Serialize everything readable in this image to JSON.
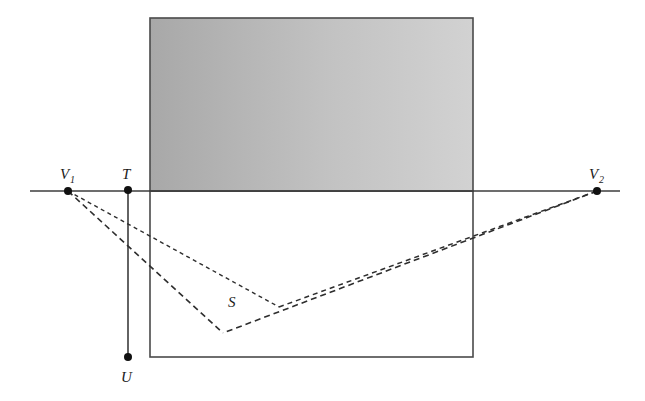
{
  "figure": {
    "kind": "perspective-construction-diagram",
    "background_color": "#ffffff",
    "stroke_color": "#3d3d3d",
    "label_color": "#1a1a1a",
    "canvas": {
      "width": 645,
      "height": 401
    }
  },
  "horizon": {
    "name": "horizon-line",
    "x1": 30,
    "y1": 191,
    "x2": 620,
    "y2": 191,
    "style": "solid",
    "width": 1.6
  },
  "shaded_panel": {
    "name": "shaded-rectangle",
    "x": 150,
    "y": 18,
    "width": 323,
    "height": 173,
    "fill_left": "#a8a8a8",
    "fill_right": "#d2d2d2",
    "border_color": "#4a4a4a",
    "border_width": 1.6
  },
  "ground_panel": {
    "name": "ground-rectangle",
    "x": 150,
    "y": 191,
    "width": 323,
    "height": 166,
    "fill": "#ffffff",
    "border_color": "#4a4a4a",
    "border_width": 1.6
  },
  "vertical_edge": {
    "name": "vertical-edge-TU",
    "x": 128,
    "y_top": 190,
    "y_bottom": 357,
    "style": "solid",
    "width": 1.6
  },
  "points": [
    {
      "id": "V1",
      "label": "V",
      "subscript": "1",
      "x": 68,
      "y": 191,
      "label_x": 60,
      "label_y": 179,
      "radius": 4.0
    },
    {
      "id": "T",
      "label": "T",
      "subscript": "",
      "x": 128,
      "y": 190,
      "label_x": 122,
      "label_y": 179,
      "radius": 4.0
    },
    {
      "id": "U",
      "label": "U",
      "subscript": "",
      "x": 128,
      "y": 357,
      "label_x": 121,
      "label_y": 382,
      "radius": 4.0
    },
    {
      "id": "V2",
      "label": "V",
      "subscript": "2",
      "x": 597,
      "y": 191,
      "label_x": 589,
      "label_y": 179,
      "radius": 4.0
    }
  ],
  "region_label": {
    "name": "region-S",
    "text": "S",
    "x": 228,
    "y": 307
  },
  "construction_lines": [
    {
      "name": "line-V1-to-vertex-B",
      "from": "V1",
      "to": "vertex-B",
      "x1": 68,
      "y1": 191,
      "x2": 223,
      "y2": 333,
      "style": "dashed",
      "dash": "6 4",
      "width": 1.6
    },
    {
      "name": "line-V1-to-vertex-C",
      "from": "V1",
      "to": "vertex-C",
      "x1": 68,
      "y1": 191,
      "x2": 279,
      "y2": 307,
      "style": "dashed",
      "dash": "4 3.5",
      "width": 1.4
    },
    {
      "name": "line-V2-to-vertex-B",
      "from": "V2",
      "to": "vertex-B",
      "x1": 597,
      "y1": 191,
      "x2": 223,
      "y2": 333,
      "style": "dashed",
      "dash": "6 4",
      "width": 1.6
    },
    {
      "name": "line-vertexC-to-V2-segment",
      "from": "vertex-C",
      "to": "V2",
      "x1": 279,
      "y1": 307,
      "x2": 597,
      "y2": 191,
      "style": "dashed",
      "dash": "5 4",
      "width": 1.5
    }
  ],
  "vertices": [
    {
      "id": "vertex-B",
      "x": 223,
      "y": 333
    },
    {
      "id": "vertex-C",
      "x": 279,
      "y": 307
    }
  ]
}
